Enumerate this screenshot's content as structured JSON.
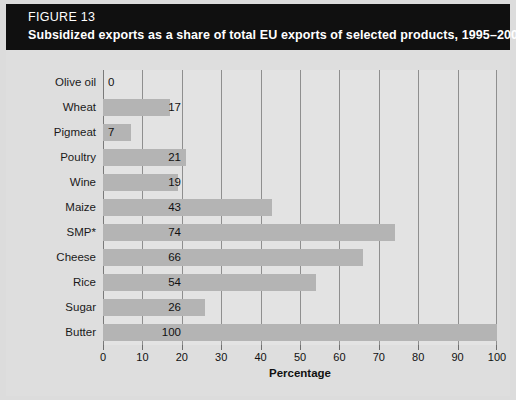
{
  "header": {
    "figure_number": "FIGURE 13",
    "title": "Subsidized exports as a share of total EU exports of selected products, 1995–2001"
  },
  "colors": {
    "header_background": "#101010",
    "header_text": "#ffffff",
    "panel_background": "#dedede",
    "plot_background": "#e3e3e3",
    "bar_fill": "#b4b4b4",
    "gridline": "#8f8f8f",
    "text": "#111111"
  },
  "chart_data": {
    "type": "bar",
    "orientation": "horizontal",
    "title": "Subsidized exports as a share of total EU exports of selected products, 1995–2001",
    "xlabel": "Percentage",
    "ylabel": "",
    "xlim": [
      0,
      100
    ],
    "xticks": [
      0,
      10,
      20,
      30,
      40,
      50,
      60,
      70,
      80,
      90,
      100
    ],
    "grid": true,
    "legend": false,
    "categories": [
      "Olive oil",
      "Wheat",
      "Pigmeat",
      "Poultry",
      "Wine",
      "Maize",
      "SMP*",
      "Cheese",
      "Rice",
      "Sugar",
      "Butter"
    ],
    "values": [
      0,
      17,
      7,
      21,
      19,
      43,
      74,
      66,
      54,
      26,
      100
    ],
    "value_labels": [
      "0",
      "17",
      "7",
      "21",
      "19",
      "43",
      "74",
      "66",
      "54",
      "26",
      "100"
    ]
  }
}
